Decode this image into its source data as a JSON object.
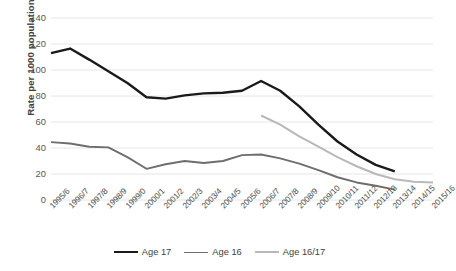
{
  "chart_data": {
    "type": "line",
    "title": "",
    "subtitle": "",
    "xlabel": "",
    "ylabel": "Rate per 1000 population",
    "ylim": [
      0,
      140
    ],
    "yticks": [
      0,
      20,
      40,
      60,
      80,
      100,
      120,
      140
    ],
    "grid": true,
    "legend_position": "bottom",
    "categories": [
      "1995/6",
      "1996/7",
      "1997/8",
      "1998/9",
      "1999/0",
      "2000/1",
      "2001/2",
      "2002/3",
      "2003/4",
      "2004/5",
      "2005/6",
      "2006/7",
      "2007/8",
      "2008/9",
      "2009/10",
      "2010/11",
      "2011/12",
      "2012/13",
      "2013/14",
      "2014/15",
      "2015/16"
    ],
    "series": [
      {
        "name": "Age 17",
        "color": "#1a1a1a",
        "width": 2.4,
        "values": [
          113,
          116.5,
          108,
          99,
          90,
          79,
          78,
          80.5,
          82,
          82.5,
          84,
          91.5,
          84,
          72,
          58,
          45,
          35,
          27,
          22,
          null,
          null
        ]
      },
      {
        "name": "Age 16",
        "color": "#6e6e6e",
        "width": 1.9,
        "values": [
          44.5,
          43.5,
          41,
          40.5,
          33,
          24,
          27.5,
          30,
          28.5,
          30,
          34.5,
          35,
          32,
          28,
          23,
          17.5,
          13.5,
          11,
          8,
          null,
          null
        ]
      },
      {
        "name": "Age 16/17",
        "color": "#b9b9b9",
        "width": 2.1,
        "values": [
          null,
          null,
          null,
          null,
          null,
          null,
          null,
          null,
          null,
          null,
          null,
          65,
          58,
          49,
          41,
          33,
          26,
          20,
          16,
          14,
          13.5
        ]
      }
    ]
  },
  "legend": {
    "items": [
      {
        "label": "Age 17",
        "color": "#1a1a1a"
      },
      {
        "label": "Age 16",
        "color": "#6e6e6e"
      },
      {
        "label": "Age 16/17",
        "color": "#b9b9b9"
      }
    ]
  },
  "axes": {
    "y_title": "Rate per 1000 population",
    "y_tick_labels": [
      "140",
      "120",
      "100",
      "80",
      "60",
      "40",
      "20",
      "0"
    ],
    "x_tick_labels": [
      "1995/6",
      "1996/7",
      "1997/8",
      "1998/9",
      "1999/0",
      "2000/1",
      "2001/2",
      "2002/3",
      "2003/4",
      "2004/5",
      "2005/6",
      "2006/7",
      "2007/8",
      "2008/9",
      "2009/10",
      "2010/11",
      "2011/12",
      "2012/13",
      "2013/14",
      "2014/15",
      "2015/16"
    ]
  },
  "style": {
    "gridline_color": "#e6e6e6",
    "background": "#ffffff"
  }
}
